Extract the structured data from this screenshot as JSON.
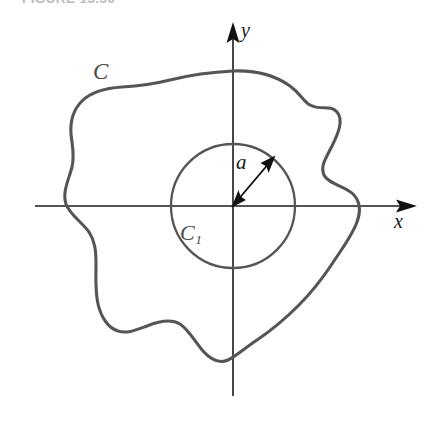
{
  "figure": {
    "caption": "FIGURE 13.30",
    "background_color": "#ffffff"
  },
  "labels": {
    "outer_curve": "C",
    "inner_circle": "C",
    "inner_circle_subscript": "1",
    "radius": "a",
    "x_axis": "x",
    "y_axis": "y"
  },
  "colors": {
    "outer_curve_stroke": "#555555",
    "inner_circle_stroke": "#555555",
    "axis_stroke": "#1a1a1a",
    "radius_arrow_stroke": "#111111",
    "caption_text": "#b9b9bd",
    "label_text": "#2b2b2b"
  },
  "geometry": {
    "origin": {
      "x": 233,
      "y": 206
    },
    "inner_circle_radius": 62,
    "x_axis": {
      "start_x": 35,
      "end_x": 417,
      "y": 206
    },
    "y_axis": {
      "x": 233,
      "start_y": 22,
      "end_y": 396
    },
    "radius_arrow": {
      "from_x": 233,
      "from_y": 206,
      "to_x": 274,
      "to_y": 158
    }
  }
}
